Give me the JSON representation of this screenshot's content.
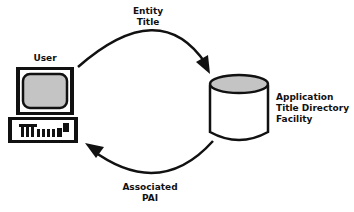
{
  "diagram": {
    "nodes": {
      "user": {
        "label": "User",
        "icon": "computer-terminal-icon"
      },
      "directory": {
        "label_lines": [
          "Application",
          "Title Directory",
          "Facility"
        ],
        "icon": "database-cylinder-icon"
      }
    },
    "edges": {
      "request": {
        "from": "user",
        "to": "directory",
        "label_lines": [
          "Entity",
          "Title"
        ]
      },
      "response": {
        "from": "directory",
        "to": "user",
        "label_lines": [
          "Associated",
          "PAI"
        ]
      }
    },
    "colors": {
      "stroke": "#111111",
      "fill_gray": "#c4c4c4",
      "background": "#ffffff"
    }
  }
}
